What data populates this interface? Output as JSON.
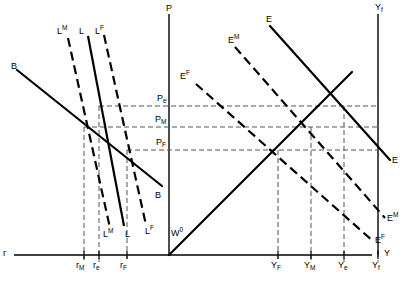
{
  "figure": {
    "type": "diagram",
    "width": 415,
    "height": 283,
    "background_color": "#ffffff",
    "line_color": "#000000",
    "dash_color": "#4a4a4a"
  },
  "axes": {
    "r_axis": {
      "label": "r",
      "orientation": "horizontal-left",
      "description": "interest rate axis running left from the P axis origin"
    },
    "p_axis": {
      "label": "P",
      "orientation": "vertical",
      "description": "price level axis, central vertical line"
    },
    "y_axis": {
      "label": "Y",
      "orientation": "horizontal-right",
      "description": "output axis running right from the P axis origin"
    },
    "yf_vertical": {
      "label": "Y",
      "sub": "f",
      "description": "full employment output vertical line at top right"
    }
  },
  "p_axis_ticks": [
    {
      "label": "P",
      "sub": "e",
      "value": "P_e"
    },
    {
      "label": "P",
      "sub": "M",
      "value": "P_M"
    },
    {
      "label": "P",
      "sub": "F",
      "value": "P_F"
    }
  ],
  "r_axis_ticks": [
    {
      "label": "r",
      "sub": "M",
      "value": "r_M"
    },
    {
      "label": "r",
      "sub": "e",
      "value": "r_e"
    },
    {
      "label": "r",
      "sub": "F",
      "value": "r_F"
    }
  ],
  "y_axis_ticks": [
    {
      "label": "Y",
      "sub": "F",
      "value": "Y_F"
    },
    {
      "label": "Y",
      "sub": "M",
      "value": "Y_M"
    },
    {
      "label": "Y",
      "sub": "e",
      "value": "Y_e"
    },
    {
      "label": "Y",
      "sub": "f",
      "value": "Y_f"
    }
  ],
  "curves": {
    "bond": {
      "name": "B",
      "top_label": "B",
      "bottom_label": "B",
      "style": "solid",
      "description": "downward sloping bond demand schedule in the left quadrant"
    },
    "money_demand": [
      {
        "name": "L",
        "sup": "M",
        "top_label": "L",
        "bottom_label": "L",
        "style": "dashed"
      },
      {
        "name": "L",
        "sup": "",
        "top_label": "L",
        "bottom_label": "L",
        "style": "solid"
      },
      {
        "name": "L",
        "sup": "F",
        "top_label": "L",
        "bottom_label": "L",
        "style": "dashed"
      }
    ],
    "expenditure": [
      {
        "name": "E",
        "sup": "",
        "left_label": "E",
        "right_label": "E",
        "style": "solid"
      },
      {
        "name": "E",
        "sup": "M",
        "left_label": "E",
        "right_label": "E",
        "style": "dashed"
      },
      {
        "name": "E",
        "sup": "F",
        "left_label": "E",
        "right_label": "E",
        "style": "dashed"
      }
    ],
    "forty_five_line": {
      "name": "W",
      "sup": "0",
      "label": "W",
      "style": "solid",
      "description": "45 degree wage / output ray from the origin"
    }
  },
  "labels": {
    "L_M": {
      "text": "L",
      "sup": "M"
    },
    "L": {
      "text": "L",
      "sup": ""
    },
    "L_F": {
      "text": "L",
      "sup": "F"
    },
    "B": {
      "text": "B"
    },
    "E": {
      "text": "E",
      "sup": ""
    },
    "E_M": {
      "text": "E",
      "sup": "M"
    },
    "E_F": {
      "text": "E",
      "sup": "F"
    },
    "W_0": {
      "text": "W",
      "sup": "0"
    },
    "P": {
      "text": "P"
    },
    "r": {
      "text": "r"
    },
    "Y": {
      "text": "Y"
    },
    "Y_f_axis": {
      "text": "Y",
      "sub": "f"
    }
  }
}
